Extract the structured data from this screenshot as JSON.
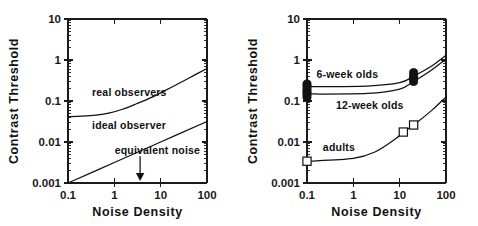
{
  "figure": {
    "kind": "two-panel-log-log-plot",
    "background": "#ffffff",
    "ink_color": "#111111"
  },
  "chart_data": [
    {
      "panel": "left",
      "type": "line",
      "title": "",
      "xlabel": "Noise Density",
      "ylabel": "Contrast Threshold",
      "xscale": "log",
      "yscale": "log",
      "xlim": [
        0.1,
        100
      ],
      "ylim": [
        0.001,
        10
      ],
      "xticks": [
        0.1,
        1,
        10,
        100
      ],
      "xticklabels": [
        "0.1",
        "1",
        "10",
        "100"
      ],
      "yticks": [
        0.001,
        0.01,
        0.1,
        1,
        10
      ],
      "yticklabels": [
        "0.001",
        "0.01",
        "0.1",
        "1",
        "10"
      ],
      "grid": false,
      "legend": "inline-annotations",
      "series": [
        {
          "name": "real observers",
          "label_text": "real observers",
          "label_x": 0.33,
          "label_y": 0.165,
          "x": [
            0.1,
            0.2,
            0.4,
            0.8,
            1.5,
            3,
            6,
            12,
            25,
            50,
            100
          ],
          "y": [
            0.0412,
            0.0425,
            0.0452,
            0.0512,
            0.0628,
            0.0855,
            0.119,
            0.176,
            0.27,
            0.41,
            0.62
          ]
        },
        {
          "name": "ideal observer",
          "label_text": "ideal observer",
          "label_x": 0.33,
          "label_y": 0.0255,
          "x": [
            0.1,
            1,
            10,
            100
          ],
          "y": [
            0.001,
            0.00316,
            0.01,
            0.0316
          ],
          "note": "straight line on log-log, slope 0.5"
        }
      ],
      "annotations": [
        {
          "name": "equivalent-noise",
          "text": "equivalent noise",
          "text_x": 8.5,
          "text_y": 0.0052,
          "arrow_x": 3.6,
          "arrow_points_to": "x-axis"
        }
      ]
    },
    {
      "panel": "right",
      "type": "line",
      "title": "",
      "xlabel": "Noise Density",
      "ylabel": "Contrast Threshold",
      "xscale": "log",
      "yscale": "log",
      "xlim": [
        0.1,
        100
      ],
      "ylim": [
        0.001,
        10
      ],
      "xticks": [
        0.1,
        1,
        10,
        100
      ],
      "xticklabels": [
        "0.1",
        "1",
        "10",
        "100"
      ],
      "yticks": [
        0.001,
        0.01,
        0.1,
        1,
        10
      ],
      "yticklabels": [
        "0.001",
        "0.01",
        "0.1",
        "1",
        "10"
      ],
      "grid": false,
      "legend": "inline-annotations",
      "series": [
        {
          "name": "6-week olds",
          "label_text": "6-week olds",
          "label_x": 0.16,
          "label_y": 0.46,
          "marker": "filled-circle",
          "x": [
            0.1,
            2,
            10,
            20,
            50,
            100
          ],
          "y": [
            0.225,
            0.232,
            0.28,
            0.4,
            0.72,
            1.3
          ],
          "points_x": [
            0.1,
            0.1,
            0.1,
            20,
            20
          ],
          "points_y": [
            0.26,
            0.225,
            0.19,
            0.49,
            0.4
          ]
        },
        {
          "name": "12-week olds",
          "label_text": "12-week olds",
          "label_x": 0.42,
          "label_y": 0.082,
          "marker": "filled-circle",
          "x": [
            0.1,
            2,
            10,
            20,
            50,
            100
          ],
          "y": [
            0.148,
            0.153,
            0.195,
            0.3,
            0.58,
            1.05
          ],
          "points_x": [
            0.1,
            0.1,
            0.1,
            20,
            20
          ],
          "points_y": [
            0.165,
            0.148,
            0.125,
            0.36,
            0.3
          ]
        },
        {
          "name": "adults",
          "label_text": "adults",
          "label_x": 0.22,
          "label_y": 0.0075,
          "marker": "open-square",
          "x": [
            0.1,
            1,
            3,
            8,
            12,
            20,
            50,
            100
          ],
          "y": [
            0.0034,
            0.004,
            0.0058,
            0.0118,
            0.0175,
            0.026,
            0.06,
            0.125
          ],
          "points_x": [
            0.1,
            12,
            20
          ],
          "points_y": [
            0.0034,
            0.0175,
            0.026
          ]
        }
      ],
      "annotations": []
    }
  ],
  "labels": {
    "ylabel": "Contrast Threshold",
    "xlabel": "Noise Density",
    "left_panel": {
      "real_observers": "real observers",
      "ideal_observer": "ideal observer",
      "equivalent_noise": "equivalent noise"
    },
    "right_panel": {
      "six_week": "6-week olds",
      "twelve_week": "12-week olds",
      "adults": "adults"
    },
    "yticks": [
      "10",
      "1",
      "0.1",
      "0.01",
      "0.001"
    ],
    "xticks": [
      "0.1",
      "1",
      "10",
      "100"
    ]
  }
}
